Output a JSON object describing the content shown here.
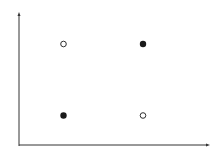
{
  "chart_data": {
    "type": "scatter",
    "title": "",
    "xlabel": "",
    "ylabel": "",
    "xlim": [
      0,
      1
    ],
    "ylim": [
      0,
      1
    ],
    "grid": false,
    "legend": null,
    "series": [
      {
        "name": "filled",
        "marker": "filled-circle",
        "color": "#1a1a1a",
        "points": [
          {
            "x": 0.25,
            "y": 0.25
          },
          {
            "x": 0.75,
            "y": 0.75
          }
        ]
      },
      {
        "name": "open",
        "marker": "open-circle",
        "color": "#1a1a1a",
        "points": [
          {
            "x": 0.25,
            "y": 0.75
          },
          {
            "x": 0.75,
            "y": 0.25
          }
        ]
      }
    ]
  },
  "style": {
    "axis_color": "#333333",
    "background": "#ffffff"
  }
}
